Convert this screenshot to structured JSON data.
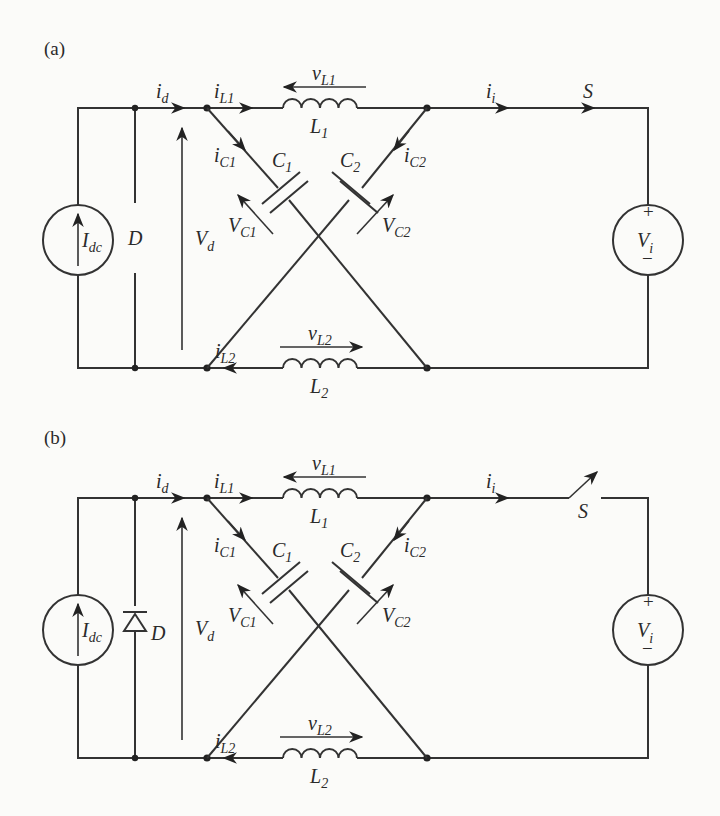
{
  "figure": {
    "panels": [
      {
        "id": "a",
        "label": "(a)",
        "switch_state": "closed",
        "labels": {
          "i_d": [
            "i",
            "d"
          ],
          "i_L1": [
            "i",
            "L1"
          ],
          "v_L1": [
            "v",
            "L1"
          ],
          "L1": [
            "L",
            "1"
          ],
          "i_i": [
            "i",
            "i"
          ],
          "S": "S",
          "i_C1": [
            "i",
            "C1"
          ],
          "C1": [
            "C",
            "1"
          ],
          "C2": [
            "C",
            "2"
          ],
          "i_C2": [
            "i",
            "C2"
          ],
          "V_C1": [
            "V",
            "C1"
          ],
          "V_C2": [
            "V",
            "C2"
          ],
          "I_dc": [
            "I",
            "dc"
          ],
          "D": "D",
          "V_d": [
            "V",
            "d"
          ],
          "V_i": [
            "V",
            "i"
          ],
          "plus": "+",
          "minus": "−",
          "i_L2": [
            "i",
            "L2"
          ],
          "v_L2": [
            "v",
            "L2"
          ],
          "L2": [
            "L",
            "2"
          ]
        },
        "diode_shown": false
      },
      {
        "id": "b",
        "label": "(b)",
        "switch_state": "open",
        "labels": {
          "i_d": [
            "i",
            "d"
          ],
          "i_L1": [
            "i",
            "L1"
          ],
          "v_L1": [
            "v",
            "L1"
          ],
          "L1": [
            "L",
            "1"
          ],
          "i_i": [
            "i",
            "i"
          ],
          "S": "S",
          "i_C1": [
            "i",
            "C1"
          ],
          "C1": [
            "C",
            "1"
          ],
          "C2": [
            "C",
            "2"
          ],
          "i_C2": [
            "i",
            "C2"
          ],
          "V_C1": [
            "V",
            "C1"
          ],
          "V_C2": [
            "V",
            "C2"
          ],
          "I_dc": [
            "I",
            "dc"
          ],
          "D": "D",
          "V_d": [
            "V",
            "d"
          ],
          "V_i": [
            "V",
            "i"
          ],
          "plus": "+",
          "minus": "−",
          "i_L2": [
            "i",
            "L2"
          ],
          "v_L2": [
            "v",
            "L2"
          ],
          "L2": [
            "L",
            "2"
          ]
        },
        "diode_shown": true
      }
    ]
  }
}
